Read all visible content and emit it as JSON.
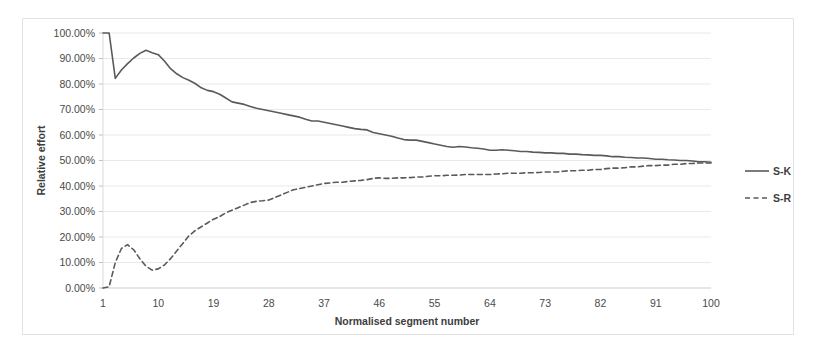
{
  "chart_data": {
    "type": "line",
    "title": "",
    "xlabel": "Normalised segment number",
    "ylabel": "Relative effort",
    "xlim": [
      1,
      100
    ],
    "ylim": [
      0,
      1
    ],
    "grid": true,
    "legend_position": "right",
    "ytick_labels": [
      "0.00%",
      "10.00%",
      "20.00%",
      "30.00%",
      "40.00%",
      "50.00%",
      "60.00%",
      "70.00%",
      "80.00%",
      "90.00%",
      "100.00%"
    ],
    "ytick_values": [
      0,
      10,
      20,
      30,
      40,
      50,
      60,
      70,
      80,
      90,
      100
    ],
    "xtick_labels": [
      "1",
      "10",
      "19",
      "28",
      "37",
      "46",
      "55",
      "64",
      "73",
      "82",
      "91",
      "100"
    ],
    "xtick_values": [
      1,
      10,
      19,
      28,
      37,
      46,
      55,
      64,
      73,
      82,
      91,
      100
    ],
    "x": [
      1,
      2,
      3,
      4,
      5,
      6,
      7,
      8,
      9,
      10,
      11,
      12,
      13,
      14,
      15,
      16,
      17,
      18,
      19,
      20,
      21,
      22,
      23,
      24,
      25,
      26,
      27,
      28,
      29,
      30,
      31,
      32,
      33,
      34,
      35,
      36,
      37,
      38,
      39,
      40,
      41,
      42,
      43,
      44,
      45,
      46,
      47,
      48,
      49,
      50,
      51,
      52,
      53,
      54,
      55,
      56,
      57,
      58,
      59,
      60,
      61,
      62,
      63,
      64,
      65,
      66,
      67,
      68,
      69,
      70,
      71,
      72,
      73,
      74,
      75,
      76,
      77,
      78,
      79,
      80,
      81,
      82,
      83,
      84,
      85,
      86,
      87,
      88,
      89,
      90,
      91,
      92,
      93,
      94,
      95,
      96,
      97,
      98,
      99,
      100
    ],
    "series": [
      {
        "name": "S-K",
        "style": "solid",
        "color": "#5a5a5a",
        "values": [
          100.0,
          100.0,
          82.2,
          85.5,
          88.0,
          90.2,
          92.0,
          93.2,
          92.3,
          91.5,
          89.0,
          86.0,
          84.0,
          82.5,
          81.5,
          80.2,
          78.5,
          77.5,
          77.0,
          76.0,
          74.5,
          73.0,
          72.5,
          72.0,
          71.2,
          70.5,
          70.0,
          69.5,
          69.0,
          68.5,
          68.0,
          67.5,
          67.0,
          66.2,
          65.5,
          65.5,
          65.0,
          64.5,
          64.0,
          63.5,
          63.0,
          62.5,
          62.2,
          62.0,
          61.0,
          60.5,
          60.0,
          59.5,
          58.8,
          58.2,
          58.0,
          58.0,
          57.5,
          57.0,
          56.5,
          56.0,
          55.5,
          55.2,
          55.5,
          55.3,
          55.0,
          54.8,
          54.5,
          54.0,
          54.0,
          54.2,
          54.0,
          53.8,
          53.5,
          53.5,
          53.3,
          53.2,
          53.0,
          53.0,
          52.8,
          52.8,
          52.5,
          52.5,
          52.3,
          52.2,
          52.0,
          52.0,
          51.8,
          51.5,
          51.5,
          51.3,
          51.2,
          51.0,
          51.0,
          50.8,
          50.5,
          50.5,
          50.3,
          50.2,
          50.0,
          50.0,
          49.8,
          49.5,
          49.5,
          49.3
        ]
      },
      {
        "name": "S-R",
        "style": "dashed",
        "color": "#5a5a5a",
        "values": [
          0.0,
          0.5,
          10.0,
          15.5,
          17.0,
          15.0,
          11.5,
          8.5,
          7.0,
          7.5,
          9.0,
          11.5,
          14.5,
          17.5,
          20.5,
          22.5,
          24.0,
          25.5,
          27.0,
          28.0,
          29.5,
          30.5,
          31.5,
          32.5,
          33.5,
          34.0,
          34.2,
          34.5,
          35.5,
          36.5,
          37.5,
          38.5,
          39.0,
          39.5,
          40.0,
          40.5,
          41.0,
          41.2,
          41.5,
          41.5,
          41.8,
          42.0,
          42.2,
          42.5,
          43.0,
          43.2,
          43.0,
          43.0,
          43.2,
          43.2,
          43.3,
          43.5,
          43.5,
          43.8,
          44.0,
          44.0,
          44.2,
          44.2,
          44.3,
          44.5,
          44.5,
          44.5,
          44.5,
          44.5,
          44.7,
          44.8,
          45.0,
          45.0,
          45.0,
          45.2,
          45.2,
          45.3,
          45.5,
          45.5,
          45.5,
          45.8,
          46.0,
          46.0,
          46.2,
          46.2,
          46.5,
          46.5,
          46.8,
          47.0,
          47.0,
          47.2,
          47.5,
          47.5,
          47.8,
          48.0,
          48.0,
          48.2,
          48.2,
          48.5,
          48.5,
          48.8,
          48.8,
          49.0,
          49.0,
          49.0
        ]
      }
    ],
    "legend": [
      {
        "label": "S-K",
        "style": "solid"
      },
      {
        "label": "S-R",
        "style": "dashed"
      }
    ]
  }
}
